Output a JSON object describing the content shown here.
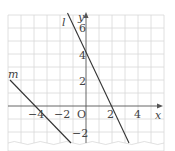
{
  "graph": {
    "origin_label": "O",
    "x_axis_label": "x",
    "y_axis_label": "y",
    "x_ticks": [
      {
        "value": -4,
        "label": "−4"
      },
      {
        "value": -2,
        "label": "−2"
      },
      {
        "value": 2,
        "label": "2"
      },
      {
        "value": 4,
        "label": "4"
      }
    ],
    "y_ticks": [
      {
        "value": 6,
        "label": "6"
      },
      {
        "value": 4,
        "label": "4"
      },
      {
        "value": 2,
        "label": "2"
      },
      {
        "value": -2,
        "label": "−2"
      }
    ],
    "lines": [
      {
        "name": "l",
        "label": "l",
        "slope": -2,
        "intercept": 4
      },
      {
        "name": "m",
        "label": "m",
        "slope": -1,
        "intercept": -4
      }
    ],
    "grid_color": "#d8d8d8",
    "line_color": "#333333"
  }
}
